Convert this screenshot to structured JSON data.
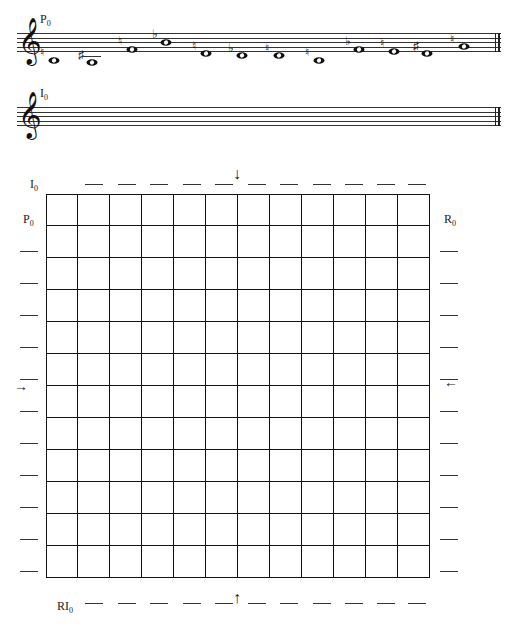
{
  "staves": [
    {
      "label": "P",
      "label_sub": "0",
      "top": 33,
      "notes": [
        {
          "x": 40,
          "step": -1,
          "accidental": "♮"
        },
        {
          "x": 78,
          "step": -2,
          "accidental": "♯"
        },
        {
          "x": 118,
          "step": 4,
          "accidental": "♮"
        },
        {
          "x": 152,
          "step": 7,
          "accidental": "♭"
        },
        {
          "x": 192,
          "step": 2,
          "accidental": "♮"
        },
        {
          "x": 228,
          "step": 1,
          "accidental": "♭"
        },
        {
          "x": 265,
          "step": 1,
          "accidental": "♮"
        },
        {
          "x": 305,
          "step": -1,
          "accidental": "♮"
        },
        {
          "x": 345,
          "step": 4,
          "accidental": "♭"
        },
        {
          "x": 380,
          "step": 3,
          "accidental": "♮"
        },
        {
          "x": 413,
          "step": 2,
          "accidental": "♯"
        },
        {
          "x": 450,
          "step": 5,
          "accidental": "♮"
        }
      ]
    },
    {
      "label": "I",
      "label_sub": "0",
      "top": 107,
      "notes": []
    }
  ],
  "clef_glyph": "𝄞",
  "matrix": {
    "rows": 12,
    "cols": 12,
    "top_label": {
      "text": "I",
      "sub": "0"
    },
    "left_label": {
      "text": "P",
      "sub": "0"
    },
    "right_label": {
      "text": "R",
      "sub": "0"
    },
    "bottom_label": {
      "text": "RI",
      "sub": "0"
    },
    "arrows": {
      "top": "↓",
      "bottom": "↑",
      "left": "→",
      "right": "←"
    }
  }
}
